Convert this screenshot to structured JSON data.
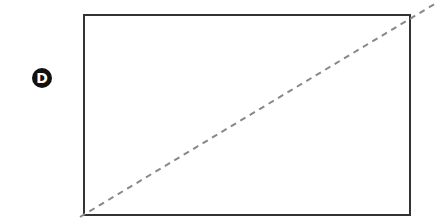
{
  "diagram": {
    "label": "D",
    "rectangle": {
      "x": 84,
      "y": 15,
      "width": 326,
      "height": 200,
      "stroke": "#333333"
    },
    "diagonal": {
      "x1": 80,
      "y1": 217,
      "x2": 438,
      "y2": 2,
      "stroke": "#888888",
      "dash": "6,5"
    },
    "colors": {
      "circle_bg": "#111111",
      "circle_text": "#ffffff"
    }
  }
}
